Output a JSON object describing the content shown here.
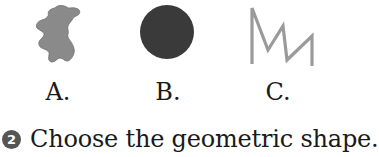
{
  "options": [
    {
      "letter": "A.",
      "shape": "irregular-blob",
      "color": "#8a8a8a"
    },
    {
      "letter": "B.",
      "shape": "circle",
      "color": "#3a3a3a"
    },
    {
      "letter": "C.",
      "shape": "zigzag-line",
      "color": "#9a9a9a"
    }
  ],
  "question": {
    "number": "2",
    "text": "Choose the geometric shape.",
    "badge_color": "#555555"
  }
}
